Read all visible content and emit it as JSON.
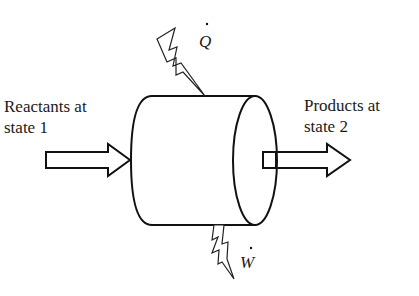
{
  "diagram": {
    "type": "steady-flow-reactor",
    "inlet": {
      "line1": "Reactants at",
      "line2": "state 1"
    },
    "outlet": {
      "line1": "Products at",
      "line2": "state 2"
    },
    "heat": {
      "symbol": "Q",
      "accent": "˙",
      "icon": "lightning-bolt-icon"
    },
    "work": {
      "symbol": "W",
      "accent": "˙",
      "icon": "lightning-bolt-icon"
    },
    "colors": {
      "stroke": "#111111",
      "background": "#ffffff"
    }
  }
}
